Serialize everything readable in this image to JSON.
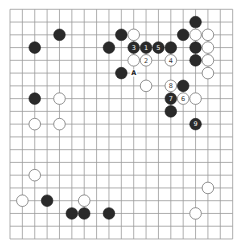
{
  "board": {
    "size": 19,
    "origin_x": 10,
    "origin_y": 9.3,
    "spacing_x": 12.37,
    "spacing_y": 12.76,
    "stone_radius": 5.8,
    "colors": {
      "background": "#ffffff",
      "grid": "#9a9a9a",
      "black": "#2a2a2a",
      "white": "#ffffff"
    }
  },
  "stones": [
    {
      "color": "black",
      "col": 15,
      "row": 1,
      "label": ""
    },
    {
      "color": "black",
      "col": 4,
      "row": 2,
      "label": ""
    },
    {
      "color": "black",
      "col": 9,
      "row": 2,
      "label": ""
    },
    {
      "color": "white",
      "col": 10,
      "row": 2,
      "label": ""
    },
    {
      "color": "black",
      "col": 14,
      "row": 2,
      "label": ""
    },
    {
      "color": "white",
      "col": 15,
      "row": 2,
      "label": ""
    },
    {
      "color": "white",
      "col": 16,
      "row": 2,
      "label": ""
    },
    {
      "color": "black",
      "col": 2,
      "row": 3,
      "label": ""
    },
    {
      "color": "black",
      "col": 8,
      "row": 3,
      "label": ""
    },
    {
      "color": "black",
      "col": 10,
      "row": 3,
      "label": "3"
    },
    {
      "color": "black",
      "col": 11,
      "row": 3,
      "label": "1"
    },
    {
      "color": "black",
      "col": 12,
      "row": 3,
      "label": "5"
    },
    {
      "color": "black",
      "col": 13,
      "row": 3,
      "label": ""
    },
    {
      "color": "black",
      "col": 15,
      "row": 3,
      "label": ""
    },
    {
      "color": "white",
      "col": 16,
      "row": 3,
      "label": ""
    },
    {
      "color": "white",
      "col": 10,
      "row": 4,
      "label": ""
    },
    {
      "color": "white",
      "col": 11,
      "row": 4,
      "label": "2"
    },
    {
      "color": "white",
      "col": 13,
      "row": 4,
      "label": "4"
    },
    {
      "color": "black",
      "col": 15,
      "row": 4,
      "label": ""
    },
    {
      "color": "white",
      "col": 16,
      "row": 4,
      "label": ""
    },
    {
      "color": "black",
      "col": 9,
      "row": 5,
      "label": ""
    },
    {
      "color": "white",
      "col": 16,
      "row": 5,
      "label": ""
    },
    {
      "color": "white",
      "col": 11,
      "row": 6,
      "label": ""
    },
    {
      "color": "white",
      "col": 13,
      "row": 6,
      "label": "8"
    },
    {
      "color": "black",
      "col": 14,
      "row": 6,
      "label": ""
    },
    {
      "color": "black",
      "col": 2,
      "row": 7,
      "label": ""
    },
    {
      "color": "white",
      "col": 4,
      "row": 7,
      "label": ""
    },
    {
      "color": "black",
      "col": 13,
      "row": 7,
      "label": "7"
    },
    {
      "color": "white",
      "col": 14,
      "row": 7,
      "label": "6"
    },
    {
      "color": "white",
      "col": 15,
      "row": 7,
      "label": ""
    },
    {
      "color": "black",
      "col": 13,
      "row": 8,
      "label": ""
    },
    {
      "color": "white",
      "col": 2,
      "row": 9,
      "label": ""
    },
    {
      "color": "white",
      "col": 4,
      "row": 9,
      "label": ""
    },
    {
      "color": "black",
      "col": 15,
      "row": 9,
      "label": "9"
    },
    {
      "color": "white",
      "col": 2,
      "row": 13,
      "label": ""
    },
    {
      "color": "white",
      "col": 16,
      "row": 14,
      "label": ""
    },
    {
      "color": "white",
      "col": 1,
      "row": 15,
      "label": ""
    },
    {
      "color": "black",
      "col": 3,
      "row": 15,
      "label": ""
    },
    {
      "color": "white",
      "col": 6,
      "row": 15,
      "label": ""
    },
    {
      "color": "black",
      "col": 5,
      "row": 16,
      "label": ""
    },
    {
      "color": "black",
      "col": 6,
      "row": 16,
      "label": ""
    },
    {
      "color": "black",
      "col": 8,
      "row": 16,
      "label": ""
    },
    {
      "color": "white",
      "col": 15,
      "row": 16,
      "label": ""
    }
  ],
  "point_labels": [
    {
      "col": 10,
      "row": 5,
      "text": "A"
    }
  ]
}
